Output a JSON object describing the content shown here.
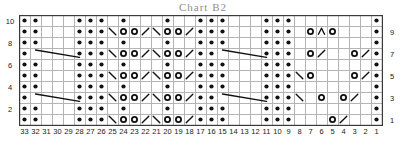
{
  "title": "Chart B2",
  "grid": {
    "cols": 33,
    "rows": 10,
    "cell": 11,
    "origin_x": 19,
    "origin_y": 15,
    "line_color": "#b4b4b4",
    "border_color": "#3a3a3a",
    "symbol_color": "#111111",
    "background": "#ffffff"
  },
  "axes": {
    "row_numbers_left": [
      "10",
      "8",
      "6",
      "4",
      "2"
    ],
    "row_numbers_right": [
      "9",
      "7",
      "5",
      "3",
      "1"
    ],
    "column_numbers": [
      "33",
      "32",
      "31",
      "30",
      "29",
      "28",
      "27",
      "26",
      "25",
      "24",
      "23",
      "22",
      "21",
      "20",
      "19",
      "18",
      "17",
      "16",
      "15",
      "14",
      "13",
      "12",
      "11",
      "10",
      "9",
      "8",
      "7",
      "6",
      "5",
      "4",
      "3",
      "2",
      "1"
    ]
  },
  "legend_symbols": {
    "dot": "purl-stitch",
    "circle": "yarn-over",
    "slash": "right-leaning-decrease",
    "backslash": "left-leaning-decrease",
    "chevron": "double-decrease",
    "long-diagonal": "travelling-stitch"
  },
  "chart_data": {
    "type": "heatmap",
    "title": "Chart B2",
    "xlabel": "",
    "ylabel": "",
    "grid": true,
    "legend": "none",
    "columns": 33,
    "rows": 10,
    "x": [
      "33",
      "32",
      "31",
      "30",
      "29",
      "28",
      "27",
      "26",
      "25",
      "24",
      "23",
      "22",
      "21",
      "20",
      "19",
      "18",
      "17",
      "16",
      "15",
      "14",
      "13",
      "12",
      "11",
      "10",
      "9",
      "8",
      "7",
      "6",
      "5",
      "4",
      "3",
      "2",
      "1"
    ],
    "y": [
      "1",
      "2",
      "3",
      "4",
      "5",
      "6",
      "7",
      "8",
      "9",
      "10"
    ],
    "symbol_key": {
      "": "empty / knit",
      "d": "dot (purl)",
      "o": "circle (yarn over)",
      "/": "slash (decrease right)",
      "\\": "backslash (decrease left)",
      "^": "chevron (double decrease)",
      "L": "long diagonal start (travel)"
    },
    "cells": {
      "10": {
        "33": "d",
        "32": "d",
        "28": "d",
        "27": "d",
        "26": "d",
        "24": "d",
        "20": "d",
        "17": "d",
        "16": "d",
        "15": "d",
        "11": "d",
        "10": "d",
        "9": "d",
        "1": "d"
      },
      "9": {
        "33": "d",
        "32": "d",
        "28": "d",
        "27": "d",
        "26": "d",
        "25": "\\",
        "24": "o",
        "23": "o",
        "22": "/",
        "21": "\\",
        "20": "o",
        "19": "o",
        "18": "/",
        "17": "d",
        "16": "d",
        "15": "d",
        "11": "d",
        "10": "d",
        "9": "d",
        "7": "o",
        "6": "^",
        "5": "o",
        "1": "d"
      },
      "8": {
        "33": "d",
        "32": "d",
        "28": "d",
        "27": "d",
        "26": "d",
        "24": "d",
        "20": "d",
        "17": "d",
        "16": "d",
        "15": "d",
        "11": "d",
        "10": "d",
        "9": "d",
        "1": "d"
      },
      "7": {
        "33": "d",
        "32": "L",
        "28": "d",
        "27": "d",
        "26": "d",
        "25": "\\",
        "24": "o",
        "23": "o",
        "22": "/",
        "21": "\\",
        "20": "o",
        "19": "o",
        "18": "/",
        "17": "d",
        "16": "d",
        "15": "L",
        "11": "d",
        "10": "d",
        "9": "d",
        "7": "o",
        "6": "/",
        "3": "o",
        "2": "/",
        "1": "d"
      },
      "6": {
        "33": "d",
        "32": "d",
        "28": "d",
        "27": "d",
        "26": "d",
        "24": "d",
        "20": "d",
        "17": "d",
        "16": "d",
        "15": "d",
        "11": "d",
        "10": "d",
        "9": "d",
        "1": "d"
      },
      "5": {
        "33": "d",
        "32": "d",
        "28": "d",
        "27": "d",
        "26": "d",
        "25": "\\",
        "24": "o",
        "23": "o",
        "22": "/",
        "21": "\\",
        "20": "o",
        "19": "o",
        "18": "/",
        "17": "d",
        "16": "d",
        "15": "d",
        "11": "d",
        "10": "d",
        "9": "d",
        "8": "\\",
        "7": "o",
        "3": "o",
        "2": "/",
        "1": "d"
      },
      "4": {
        "33": "d",
        "32": "d",
        "28": "d",
        "27": "d",
        "26": "d",
        "24": "d",
        "20": "d",
        "17": "d",
        "16": "d",
        "15": "d",
        "11": "d",
        "10": "d",
        "9": "d",
        "1": "d"
      },
      "3": {
        "33": "d",
        "32": "L",
        "28": "d",
        "27": "d",
        "26": "d",
        "25": "\\",
        "24": "o",
        "23": "o",
        "22": "/",
        "21": "\\",
        "20": "o",
        "19": "o",
        "18": "/",
        "17": "d",
        "16": "d",
        "15": "L",
        "11": "d",
        "10": "d",
        "9": "d",
        "8": "\\",
        "6": "o",
        "4": "o",
        "3": "/",
        "1": "d"
      },
      "2": {
        "33": "d",
        "32": "d",
        "28": "d",
        "27": "d",
        "26": "d",
        "24": "d",
        "20": "d",
        "17": "d",
        "16": "d",
        "15": "d",
        "11": "d",
        "10": "d",
        "9": "d",
        "1": "d"
      },
      "1": {
        "33": "d",
        "32": "d",
        "28": "d",
        "27": "d",
        "26": "d",
        "25": "\\",
        "24": "o",
        "23": "o",
        "22": "/",
        "21": "\\",
        "20": "o",
        "19": "o",
        "18": "/",
        "17": "d",
        "16": "d",
        "15": "d",
        "11": "d",
        "10": "d",
        "9": "d",
        "5": "o",
        "4": "/",
        "1": "d"
      }
    },
    "long_diagonals": [
      {
        "row": "7",
        "from_col": "32",
        "to_col": "28"
      },
      {
        "row": "7",
        "from_col": "15",
        "to_col": "11"
      },
      {
        "row": "3",
        "from_col": "32",
        "to_col": "28"
      },
      {
        "row": "3",
        "from_col": "15",
        "to_col": "11"
      }
    ]
  }
}
